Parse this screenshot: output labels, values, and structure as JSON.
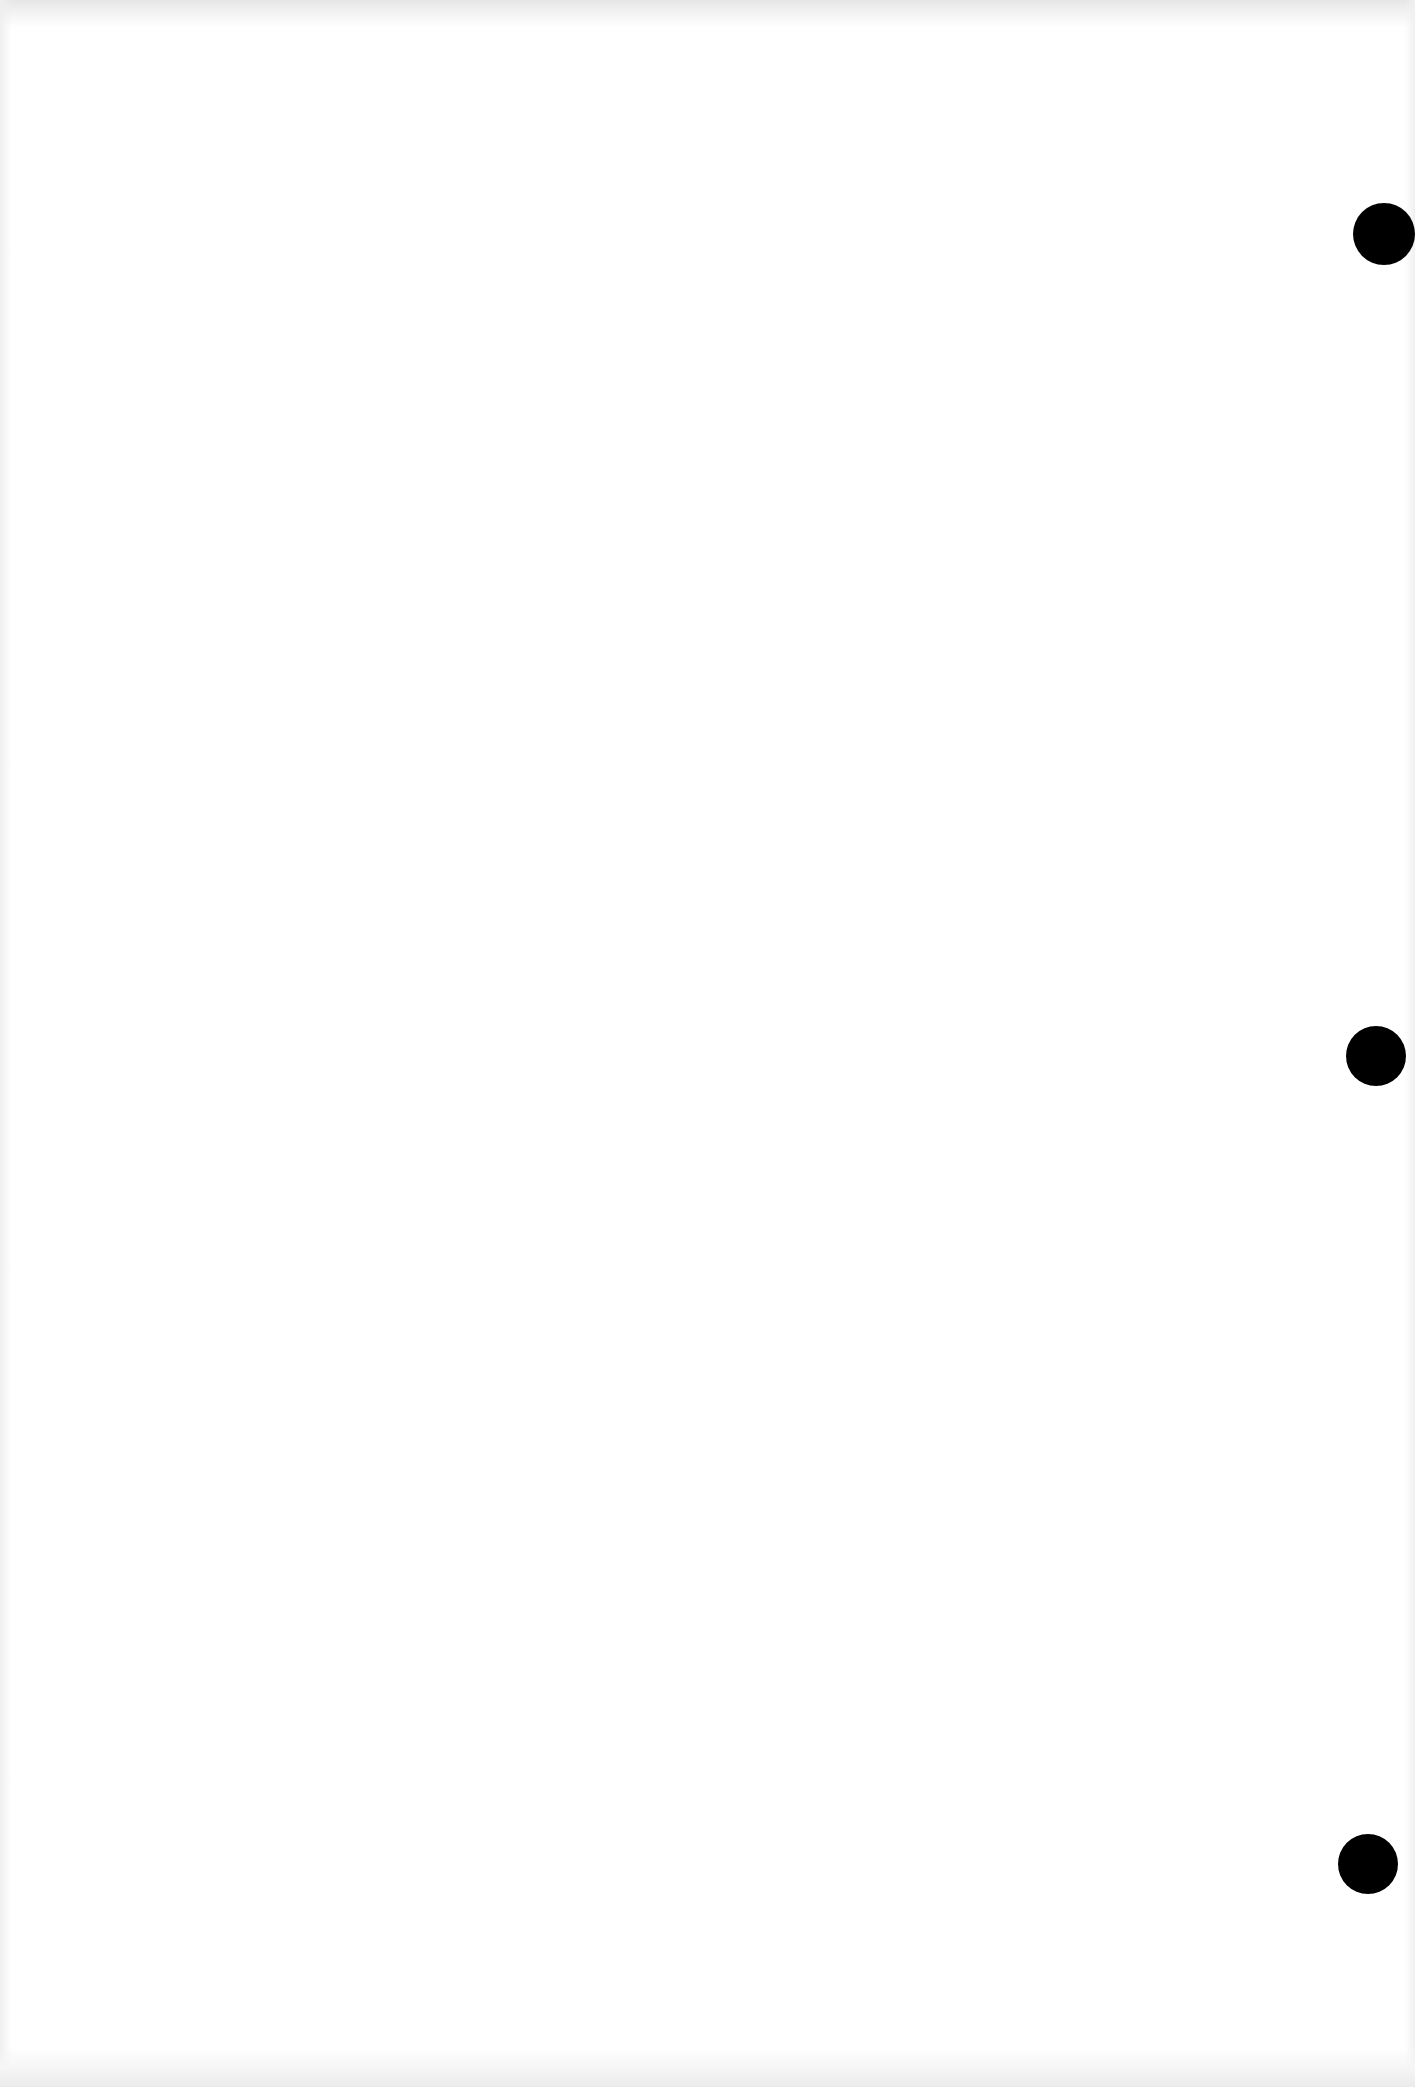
{
  "document": {
    "type": "blank three-hole-punched sheet",
    "background_color": "#ffffff",
    "text_content": "",
    "punch_holes": [
      {
        "cx": 1384,
        "cy": 234,
        "diameter": 62,
        "color": "#000000"
      },
      {
        "cx": 1376,
        "cy": 1056,
        "diameter": 60,
        "color": "#000000"
      },
      {
        "cx": 1368,
        "cy": 1864,
        "diameter": 60,
        "color": "#000000"
      }
    ]
  }
}
